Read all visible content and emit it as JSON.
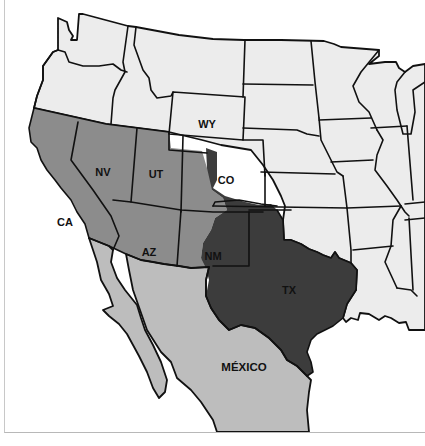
{
  "map": {
    "title": "",
    "colors": {
      "us_states_other": "#ececec",
      "mexican_cession": "#8c8c8c",
      "texas_annexation": "#3c3c3c",
      "mexico": "#bdbdbd",
      "water": "#ffffff",
      "border": "#111111"
    },
    "labels": {
      "wy": "WY",
      "ca": "CA",
      "nv": "NV",
      "ut": "UT",
      "co": "CO",
      "az": "AZ",
      "nm": "NM",
      "tx": "TX",
      "mexico": "MÉXICO"
    }
  }
}
